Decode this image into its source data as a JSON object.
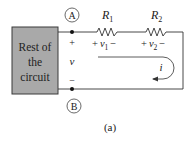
{
  "diagram": {
    "block_label_lines": [
      "Rest of",
      "the",
      "circuit"
    ],
    "nodes": [
      {
        "id": "A",
        "label": "A"
      },
      {
        "id": "B",
        "label": "B"
      }
    ],
    "terminal_voltage": {
      "plus": "+",
      "symbol": "v",
      "minus": "−"
    },
    "resistors": [
      {
        "name": "R",
        "subscript": "1",
        "voltage_plus": "+",
        "voltage_symbol": "v",
        "voltage_subscript": "1",
        "voltage_minus": "−"
      },
      {
        "name": "R",
        "subscript": "2",
        "voltage_plus": "+",
        "voltage_symbol": "v",
        "voltage_subscript": "2",
        "voltage_minus": "−"
      }
    ],
    "current": {
      "symbol": "i",
      "direction": "clockwise"
    },
    "caption": "(a)",
    "colors": {
      "block_fill": "#a9a9a9",
      "block_stroke": "#3a3a3a",
      "wire": "#333333"
    }
  }
}
